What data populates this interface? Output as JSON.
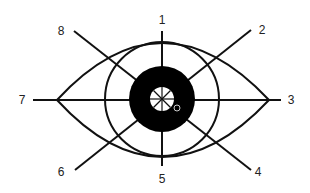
{
  "diagram": {
    "directions": [
      {
        "label": "1",
        "x": 162,
        "y": 20
      },
      {
        "label": "2",
        "x": 262,
        "y": 30
      },
      {
        "label": "3",
        "x": 291,
        "y": 100
      },
      {
        "label": "4",
        "x": 258,
        "y": 172
      },
      {
        "label": "5",
        "x": 162,
        "y": 179
      },
      {
        "label": "6",
        "x": 61,
        "y": 172
      },
      {
        "label": "7",
        "x": 22,
        "y": 100
      },
      {
        "label": "8",
        "x": 61,
        "y": 31
      }
    ],
    "colors": {
      "stroke": "#111111",
      "iris": "#000000",
      "pupil": "#ffffff",
      "label": "#222222"
    }
  }
}
